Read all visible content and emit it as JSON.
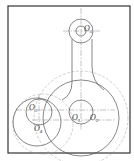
{
  "diagram": {
    "type": "mechanical-drawing",
    "colors": {
      "stroke": "#555555",
      "construction": "#9a9a9a",
      "frame": "#333333",
      "background": "#ffffff"
    },
    "labels": [
      {
        "id": "O1",
        "text": "O",
        "sub": "1",
        "x": 73,
        "y": 120
      },
      {
        "id": "O2",
        "text": "O",
        "sub": "2",
        "x": 90,
        "y": 120
      },
      {
        "id": "O3",
        "text": "O",
        "sub": "3",
        "x": 29,
        "y": 109
      },
      {
        "id": "O4",
        "text": "O",
        "sub": "4",
        "x": 35,
        "y": 130
      },
      {
        "id": "O5",
        "text": "O",
        "sub": "5",
        "x": 84,
        "y": 31
      }
    ]
  }
}
